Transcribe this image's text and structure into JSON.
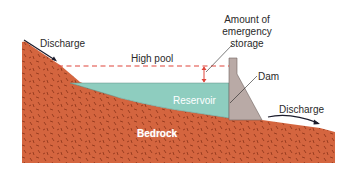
{
  "diagram": {
    "labels": {
      "discharge_left": "Discharge",
      "high_pool": "High pool",
      "emergency_storage_line1": "Amount of",
      "emergency_storage_line2": "emergency",
      "emergency_storage_line3": "storage",
      "dam": "Dam",
      "reservoir": "Reservoir",
      "discharge_right": "Discharge",
      "bedrock": "Bedrock"
    },
    "colors": {
      "bedrock": "#d4653f",
      "bedrock_speckle": "#8a3218",
      "reservoir": "#8ecdbf",
      "dam": "#b9aaa6",
      "high_pool_line": "#e0443a",
      "arrow": "#1a1a2a",
      "background": "#ffffff"
    }
  }
}
